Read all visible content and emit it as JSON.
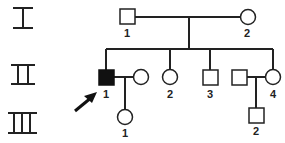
{
  "generations": [
    {
      "roman": "I",
      "members": [
        {
          "id": "I-1",
          "label": "1",
          "sex": "male",
          "affected": false
        },
        {
          "id": "I-2",
          "label": "2",
          "sex": "female",
          "affected": false
        }
      ]
    },
    {
      "roman": "II",
      "members": [
        {
          "id": "II-1",
          "label": "1",
          "sex": "male",
          "affected": true,
          "proband": true
        },
        {
          "id": "II-1-spouse",
          "label": "",
          "sex": "female",
          "affected": false
        },
        {
          "id": "II-2",
          "label": "2",
          "sex": "female",
          "affected": false
        },
        {
          "id": "II-3",
          "label": "3",
          "sex": "male",
          "affected": false
        },
        {
          "id": "II-4-spouse",
          "label": "",
          "sex": "male",
          "affected": false
        },
        {
          "id": "II-4",
          "label": "4",
          "sex": "female",
          "affected": false
        }
      ]
    },
    {
      "roman": "III",
      "members": [
        {
          "id": "III-1",
          "label": "1",
          "sex": "female",
          "affected": false
        },
        {
          "id": "III-2",
          "label": "2",
          "sex": "male",
          "affected": false
        }
      ]
    }
  ],
  "labels": {
    "i1": "1",
    "i2": "2",
    "ii1": "1",
    "ii2": "2",
    "ii3": "3",
    "ii4": "4",
    "iii1": "1",
    "iii2": "2"
  },
  "colors": {
    "line": "#222222",
    "affected": "#111111",
    "background": "#ffffff"
  }
}
